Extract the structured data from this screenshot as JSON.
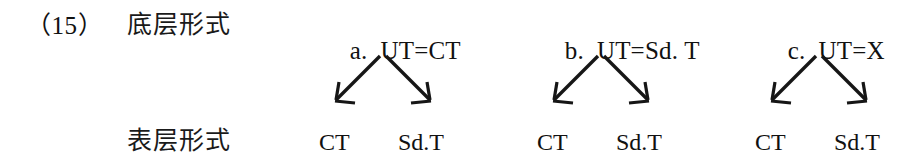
{
  "example": {
    "number_label": "（15）"
  },
  "rows": {
    "underlying_label": "底层形式",
    "surface_label": "表层形式"
  },
  "derivations": [
    {
      "marker": "a.",
      "underlying": "UT=CT",
      "outputs": [
        "CT",
        "Sd.T"
      ]
    },
    {
      "marker": "b.",
      "underlying": "UT=Sd. T",
      "outputs": [
        "CT",
        "Sd.T"
      ]
    },
    {
      "marker": "c.",
      "underlying": "UT=X",
      "outputs": [
        "CT",
        "Sd.T"
      ]
    }
  ],
  "arrows": {
    "left_arrow_name": "down-left-arrow-icon",
    "right_arrow_name": "down-right-arrow-icon"
  },
  "colors": {
    "ink": "#161616",
    "page": "#ffffff"
  }
}
